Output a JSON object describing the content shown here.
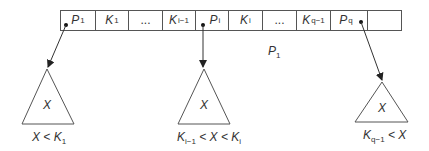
{
  "node": {
    "label": "P",
    "label_sub": "1",
    "cells": [
      {
        "main": "P",
        "sub": "1",
        "kind": "pointer"
      },
      {
        "main": "K",
        "sub": "1",
        "kind": "key"
      },
      {
        "main": "...",
        "sub": "",
        "kind": "ellipsis"
      },
      {
        "main": "K",
        "sub": "i−1",
        "kind": "key"
      },
      {
        "main": "P",
        "sub": "i",
        "kind": "pointer"
      },
      {
        "main": "K",
        "sub": "i",
        "kind": "key"
      },
      {
        "main": "...",
        "sub": "",
        "kind": "ellipsis"
      },
      {
        "main": "K",
        "sub": "q−1",
        "kind": "key"
      },
      {
        "main": "P",
        "sub": "q",
        "kind": "pointer"
      },
      {
        "main": "",
        "sub": "",
        "kind": "empty"
      }
    ]
  },
  "subtrees": [
    {
      "inner": "X",
      "condition": {
        "parts": [
          {
            "t": "X < K"
          },
          {
            "s": "1"
          }
        ]
      }
    },
    {
      "inner": "X",
      "condition": {
        "parts": [
          {
            "t": "K"
          },
          {
            "s": "i−1"
          },
          {
            "t": " < X < K"
          },
          {
            "s": "i"
          }
        ]
      }
    },
    {
      "inner": "X",
      "condition": {
        "parts": [
          {
            "t": "K"
          },
          {
            "s": "q−1"
          },
          {
            "t": " < X"
          }
        ]
      }
    }
  ],
  "colors": {
    "line": "#444444",
    "text": "#333333",
    "background": "#ffffff"
  }
}
